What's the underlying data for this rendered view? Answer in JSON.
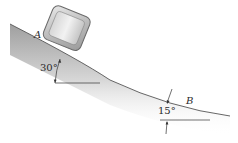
{
  "diagram": {
    "type": "physics-incline-diagram",
    "labels": {
      "point_a": "A",
      "point_b": "B",
      "angle_a": "30°",
      "angle_b": "15°"
    },
    "colors": {
      "surface_shade_dark": "#9a9a9a",
      "surface_shade_light": "#ffffff",
      "block_fill": "#c8c8c8",
      "block_edge": "#6a6a6a",
      "line": "#333333",
      "text": "#2a2a2a"
    }
  }
}
